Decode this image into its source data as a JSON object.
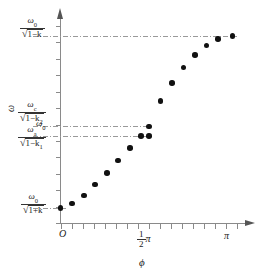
{
  "figure": {
    "kind": "scatter",
    "background": "#ffffff",
    "point_color": "#111111",
    "axis_color": "#8a8a8a",
    "guide_color": "#9a9a9a"
  },
  "axes": {
    "y_label": "ω",
    "x_label": "ϕ",
    "origin_label": "O",
    "x_ticks": [
      {
        "label": "",
        "pos": 0
      },
      {
        "label": "½π",
        "pos": 0.5
      },
      {
        "label": "π",
        "pos": 1.0
      }
    ],
    "x_tick_half_pi_numerator": "1",
    "x_tick_half_pi_denominator": "2",
    "x_tick_half_pi_symbol": "π",
    "x_tick_pi_symbol": "π"
  },
  "y_labels": [
    {
      "id": "upper-branch-limit",
      "numerator": "ω",
      "numerator_sub": "0",
      "denominator_radicand": "1−k",
      "denominator_sub": "",
      "value_norm": 0.95
    },
    {
      "id": "omega-c-level",
      "numerator": "ω",
      "numerator_sub": "c",
      "denominator_radicand": "1−k",
      "denominator_sub": "2",
      "value_norm": 0.49
    },
    {
      "id": "omega-zero-level",
      "numerator": "ω",
      "numerator_sub": "0",
      "denominator_radicand": "",
      "denominator_sub": "",
      "value_norm": 0.443
    },
    {
      "id": "omega-a-level",
      "numerator": "ω",
      "numerator_sub": "a",
      "denominator_radicand": "1−k",
      "denominator_sub": "1",
      "value_norm": 0.443
    },
    {
      "id": "lower-branch-start",
      "numerator": "ω",
      "numerator_sub": "0",
      "denominator_radicand": "1+k",
      "denominator_sub": "",
      "value_norm": 0.075
    }
  ],
  "guide_lines": [
    {
      "id": "guide-top",
      "y_norm": 0.95,
      "x_from": 0.0,
      "x_to": 1.0,
      "style": "dash-dot"
    },
    {
      "id": "guide-wc",
      "y_norm": 0.49,
      "x_from": 0.0,
      "x_to": 0.5,
      "style": "dash-dot"
    },
    {
      "id": "guide-wa",
      "y_norm": 0.443,
      "x_from": 0.0,
      "x_to": 0.5,
      "style": "dash-dot"
    },
    {
      "id": "guide-bottom",
      "y_norm": 0.075,
      "x_from": 0.0,
      "x_to": 0.03,
      "style": "dash-dot"
    }
  ],
  "chart_data": {
    "type": "scatter",
    "title": "",
    "xlabel": "ϕ",
    "ylabel": "ω",
    "xlim": [
      0,
      3.1416
    ],
    "ylim": [
      0,
      1
    ],
    "xticklabels": [
      "O",
      "1/2 π",
      "π"
    ],
    "yticklabels": [
      "ω_0/√(1+k)",
      "ω_a/√(1−k_1)",
      "ω_0",
      "ω_c/√(1−k_2)",
      "ω_0/√(1−k)"
    ],
    "grid": false,
    "legend": null,
    "annotations": [
      "dash-dot line at ω_0/√(1−k) spanning full width",
      "dash-dot line at ω_c/√(1−k_2) from axis to ϕ=½π",
      "dash-dot line at ω_a/√(1−k_1) from axis to ϕ=½π",
      "two points coincide in ϕ at ½π marking the branch gap"
    ],
    "series": [
      {
        "name": "dispersion branch",
        "x": [
          0.0,
          0.2,
          0.41,
          0.61,
          0.82,
          1.02,
          1.23,
          1.43,
          1.57,
          1.57,
          1.78,
          1.98,
          2.19,
          2.39,
          2.6,
          2.8,
          3.06
        ],
        "y": [
          0.075,
          0.098,
          0.14,
          0.195,
          0.255,
          0.318,
          0.382,
          0.443,
          0.443,
          0.49,
          0.62,
          0.71,
          0.79,
          0.853,
          0.9,
          0.935,
          0.95
        ]
      }
    ]
  }
}
